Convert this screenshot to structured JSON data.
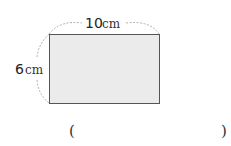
{
  "figure": {
    "shape": "rectangle",
    "fill": "#ebebeb",
    "stroke": "#555555",
    "width_label": {
      "num": "10",
      "unit": "cm"
    },
    "height_label": {
      "num": "6",
      "unit": "cm"
    }
  },
  "answer": {
    "open": "(",
    "close": ")",
    "value": ""
  }
}
